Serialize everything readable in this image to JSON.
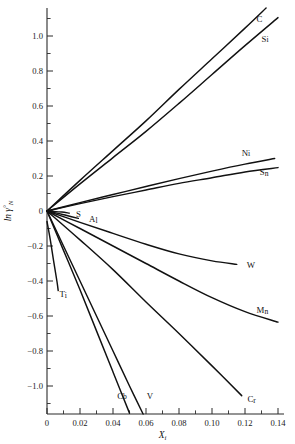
{
  "chart_data": {
    "type": "line",
    "title": "",
    "subtitle": "",
    "xlabel": "X_i",
    "xlabel_main": "X",
    "xlabel_sub": "i",
    "ylabel": "ln γ°_N",
    "ylabel_main": "ln γ",
    "ylabel_sup": "°",
    "ylabel_sub": "N",
    "xlim": [
      0,
      0.145
    ],
    "ylim": [
      -1.16,
      1.16
    ],
    "xticks": [
      0,
      0.02,
      0.04,
      0.06,
      0.08,
      0.1,
      0.12,
      0.14
    ],
    "xticklabels": [
      "0",
      "0.02",
      "0.04",
      "0.06",
      "0.08",
      "0.10",
      "0.12",
      "0.14"
    ],
    "xtick_minor_step": 0.01,
    "yticks": [
      -1.0,
      -0.8,
      -0.6,
      -0.4,
      -0.2,
      0,
      0.2,
      0.4,
      0.6,
      0.8,
      1.0
    ],
    "yticklabels": [
      "−1.0",
      "−0.8",
      "−0.6",
      "−0.4",
      "−0.2",
      "0",
      "0.2",
      "0.4",
      "0.6",
      "0.8",
      "1.0"
    ],
    "ytick_minor_step": 0.1,
    "grid": false,
    "legend_position": "inline-end-of-line",
    "line_color": "#111111",
    "axis_color": "#2b2b2b",
    "background_color": "#ffffff",
    "series": [
      {
        "name": "C",
        "label": "C",
        "label_x": 0.127,
        "label_y": 1.1,
        "points": [
          [
            0,
            0
          ],
          [
            0.02,
            0.175
          ],
          [
            0.04,
            0.345
          ],
          [
            0.06,
            0.515
          ],
          [
            0.08,
            0.695
          ],
          [
            0.1,
            0.87
          ],
          [
            0.12,
            1.045
          ],
          [
            0.14,
            1.225
          ]
        ]
      },
      {
        "name": "Si",
        "label": "Si",
        "label_x": 0.13,
        "label_y": 0.985,
        "points": [
          [
            0,
            0
          ],
          [
            0.02,
            0.155
          ],
          [
            0.04,
            0.305
          ],
          [
            0.06,
            0.455
          ],
          [
            0.08,
            0.615
          ],
          [
            0.1,
            0.78
          ],
          [
            0.12,
            0.945
          ],
          [
            0.14,
            1.105
          ]
        ]
      },
      {
        "name": "Ni",
        "label": "Ni",
        "label_x": 0.118,
        "label_y": 0.335,
        "points": [
          [
            0,
            0
          ],
          [
            0.02,
            0.048
          ],
          [
            0.04,
            0.094
          ],
          [
            0.06,
            0.14
          ],
          [
            0.08,
            0.185
          ],
          [
            0.1,
            0.228
          ],
          [
            0.12,
            0.268
          ],
          [
            0.138,
            0.3
          ]
        ]
      },
      {
        "name": "Sn",
        "label": "Sn",
        "label_x": 0.129,
        "label_y": 0.222,
        "points": [
          [
            0,
            0
          ],
          [
            0.02,
            0.042
          ],
          [
            0.04,
            0.082
          ],
          [
            0.06,
            0.12
          ],
          [
            0.08,
            0.158
          ],
          [
            0.1,
            0.19
          ],
          [
            0.12,
            0.223
          ],
          [
            0.14,
            0.248
          ]
        ]
      },
      {
        "name": "S",
        "label": "S",
        "label_x": 0.0175,
        "label_y": -0.015,
        "points": [
          [
            0,
            0
          ],
          [
            0.004,
            -0.002
          ],
          [
            0.009,
            -0.006
          ],
          [
            0.0135,
            -0.012
          ]
        ]
      },
      {
        "name": "Al",
        "label": "Al",
        "label_x": 0.0255,
        "label_y": -0.045,
        "points": [
          [
            0,
            0
          ],
          [
            0.006,
            -0.012
          ],
          [
            0.012,
            -0.026
          ],
          [
            0.019,
            -0.042
          ]
        ]
      },
      {
        "name": "W",
        "label": "W",
        "label_x": 0.121,
        "label_y": -0.305,
        "points": [
          [
            0,
            0
          ],
          [
            0.02,
            -0.065
          ],
          [
            0.04,
            -0.128
          ],
          [
            0.06,
            -0.19
          ],
          [
            0.08,
            -0.245
          ],
          [
            0.1,
            -0.285
          ],
          [
            0.115,
            -0.305
          ]
        ]
      },
      {
        "name": "Mn",
        "label": "Mn",
        "label_x": 0.127,
        "label_y": -0.565,
        "points": [
          [
            0,
            0
          ],
          [
            0.02,
            -0.1
          ],
          [
            0.04,
            -0.2
          ],
          [
            0.06,
            -0.3
          ],
          [
            0.08,
            -0.4
          ],
          [
            0.1,
            -0.495
          ],
          [
            0.12,
            -0.575
          ],
          [
            0.14,
            -0.635
          ]
        ]
      },
      {
        "name": "Cr",
        "label": "Cr",
        "label_x": 0.1215,
        "label_y": -1.075,
        "points": [
          [
            0,
            0
          ],
          [
            0.02,
            -0.165
          ],
          [
            0.04,
            -0.335
          ],
          [
            0.06,
            -0.52
          ],
          [
            0.08,
            -0.7
          ],
          [
            0.1,
            -0.885
          ],
          [
            0.118,
            -1.055
          ]
        ]
      },
      {
        "name": "V",
        "label": "V",
        "label_x": 0.0605,
        "label_y": -1.055,
        "points": [
          [
            0,
            0
          ],
          [
            0.01,
            -0.2
          ],
          [
            0.02,
            -0.4
          ],
          [
            0.03,
            -0.6
          ],
          [
            0.04,
            -0.8
          ],
          [
            0.05,
            -1.0
          ],
          [
            0.0585,
            -1.165
          ]
        ]
      },
      {
        "name": "Cb",
        "label": "Cb",
        "label_x": 0.0425,
        "label_y": -1.055,
        "points": [
          [
            0,
            0
          ],
          [
            0.01,
            -0.225
          ],
          [
            0.02,
            -0.45
          ],
          [
            0.03,
            -0.685
          ],
          [
            0.04,
            -0.92
          ],
          [
            0.05,
            -1.155
          ]
        ]
      },
      {
        "name": "Ti",
        "label": "Ti",
        "label_x": 0.0075,
        "label_y": -0.475,
        "points": [
          [
            0,
            -0.06
          ],
          [
            0.002,
            -0.165
          ],
          [
            0.004,
            -0.285
          ],
          [
            0.006,
            -0.4
          ],
          [
            0.0068,
            -0.455
          ]
        ]
      }
    ]
  }
}
